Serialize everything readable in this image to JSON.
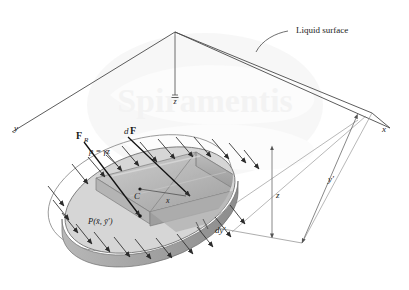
{
  "figure": {
    "background_color": "#ffffff",
    "line_color": "#3a3a3a",
    "arrow_color": "#2b2b2b",
    "plate_fill": "#d2d2d2",
    "wedge_fill": "#a9a9a9",
    "wedge_fill_light": "#c4c4c4",
    "watermark_color": "#efefef"
  },
  "labels": {
    "liquid_surface": "Liquid surface",
    "axis_x_surface": "x",
    "axis_y_surface": "y",
    "axis_x_plate": "x",
    "depth_centroid": "z",
    "depth_centroid_bar": "‾",
    "depth_element": "z",
    "dim_yprime": "y′",
    "dim_dyprime": "dy′",
    "resultant_force": "F",
    "resultant_force_sub": "R",
    "differential_force": "dF",
    "differential_force_d": "d",
    "differential_force_F": "F",
    "pressure_eq": "p = γz",
    "centroid": "C",
    "point_P": "P(x̄, ȳ′)",
    "watermark": "Spiramentis"
  },
  "geometry": {
    "surface_apex": [
      175,
      32
    ],
    "surface_left": [
      12,
      132
    ],
    "surface_right": [
      390,
      128
    ],
    "surface_corner_right": [
      372,
      113
    ],
    "vertical_from_apex_end": [
      175,
      97
    ],
    "z_dim_top": [
      272,
      150
    ],
    "z_dim_bottom": [
      272,
      238
    ],
    "yprime_dim_top": [
      356,
      118
    ],
    "yprime_dim_bottom": [
      302,
      243
    ],
    "plate_center": [
      150,
      200
    ],
    "plate_rx": 88,
    "plate_ry": 48,
    "plate_rotation_deg": -18
  },
  "annotations": {
    "arrow_count_upper": 11,
    "arrow_count_lower": 12,
    "arrow_direction": "down-right, normal to plate",
    "leader_liquid_surface_from": [
      287,
      32
    ],
    "leader_liquid_surface_to": [
      256,
      52
    ]
  }
}
